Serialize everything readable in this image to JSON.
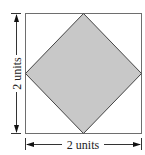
{
  "diagram": {
    "outer_square": {
      "stroke": "#6e6e6e",
      "fill": "#ffffff"
    },
    "inner_diamond": {
      "stroke": "#444444",
      "fill": "#c8c8c8"
    },
    "labels": {
      "width": "2 units",
      "height": "2 units"
    }
  }
}
